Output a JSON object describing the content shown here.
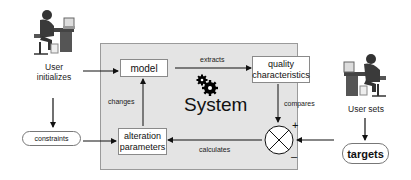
{
  "diagram": {
    "system": {
      "title": "System",
      "icon": "gears-icon",
      "background": "#e4e4e4"
    },
    "nodes": {
      "model": "model",
      "quality": [
        "quality",
        "characteristics"
      ],
      "alteration": [
        "alteration",
        "parameters"
      ],
      "constraints": "constraints",
      "targets": "targets",
      "comparator": {
        "symbol": "⊗",
        "plus": "+",
        "minus": "–"
      }
    },
    "edge_labels": {
      "extracts": "extracts",
      "changes": "changes",
      "compares": "compares",
      "calculates": "calculates"
    },
    "actors": {
      "left": {
        "label_line1": "User",
        "label_line2": "initializes",
        "icon": "user-at-computer-icon"
      },
      "right": {
        "label": "User sets",
        "icon": "user-at-computer-icon"
      }
    },
    "edges": [
      {
        "from": "User initializes",
        "to": "model"
      },
      {
        "from": "User initializes",
        "to": "constraints"
      },
      {
        "from": "constraints",
        "to": "alteration parameters"
      },
      {
        "from": "model",
        "to": "quality characteristics",
        "label": "extracts"
      },
      {
        "from": "alteration parameters",
        "to": "model",
        "label": "changes"
      },
      {
        "from": "quality characteristics",
        "to": "comparator",
        "label": "compares"
      },
      {
        "from": "comparator",
        "to": "alteration parameters",
        "label": "calculates"
      },
      {
        "from": "User sets",
        "to": "targets"
      },
      {
        "from": "targets",
        "to": "comparator"
      }
    ]
  }
}
